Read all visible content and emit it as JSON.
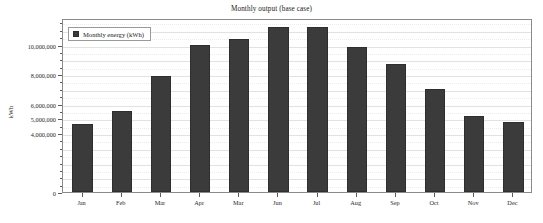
{
  "chart_data": {
    "type": "bar",
    "title": "Monthly output (base case)",
    "xlabel": "",
    "ylabel": "kWh",
    "categories": [
      "Jan",
      "Feb",
      "Mar",
      "Apr",
      "Mar",
      "Jun",
      "Jul",
      "Aug",
      "Sep",
      "Oct",
      "Nov",
      "Dec"
    ],
    "series": [
      {
        "name": "Monthly energy (kWh)",
        "color": "#3b3b3b",
        "values": [
          4600000,
          5500000,
          7900000,
          10000000,
          10400000,
          11200000,
          11200000,
          9850000,
          8700000,
          7000000,
          5150000,
          4750000
        ]
      }
    ],
    "ylim": [
      0,
      11800000
    ],
    "ytick_values": [
      10000000,
      8000000,
      6000000,
      5000000,
      4000000,
      0
    ],
    "ytick_labels": [
      "10,000,000",
      "8,000,000",
      "6,000,000",
      "5,000,000",
      "4,000,000",
      "0"
    ],
    "grid": true,
    "legend_position": "top-left"
  },
  "legend": {
    "entries": [
      {
        "label": "Monthly energy (kWh)",
        "color": "#3b3b3b"
      }
    ]
  }
}
